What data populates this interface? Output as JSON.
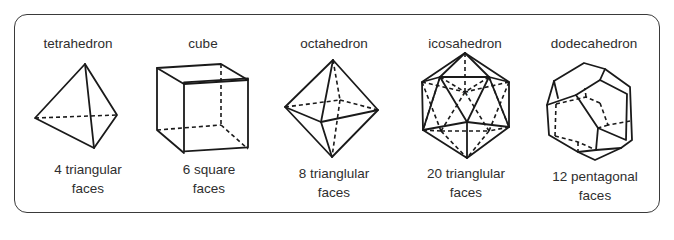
{
  "figure": {
    "solids": [
      {
        "name": "tetrahedron",
        "faces_line1": "4 triangular",
        "faces_line2": "faces",
        "face_count": 4,
        "face_shape": "triangular"
      },
      {
        "name": "cube",
        "faces_line1": "6 square",
        "faces_line2": "faces",
        "face_count": 6,
        "face_shape": "square"
      },
      {
        "name": "octahedron",
        "faces_line1": "8 trianglular",
        "faces_line2": "faces",
        "face_count": 8,
        "face_shape": "triangular"
      },
      {
        "name": "icosahedron",
        "faces_line1": "20 trianglular",
        "faces_line2": "faces",
        "face_count": 20,
        "face_shape": "triangular"
      },
      {
        "name": "dodecahedron",
        "faces_line1": "12 pentagonal",
        "faces_line2": "faces",
        "face_count": 12,
        "face_shape": "pentagonal"
      }
    ]
  },
  "colors": {
    "stroke": "#1a1a1a",
    "text": "#2e2e2e",
    "frame": "#3a3a3a",
    "background": "#ffffff"
  }
}
